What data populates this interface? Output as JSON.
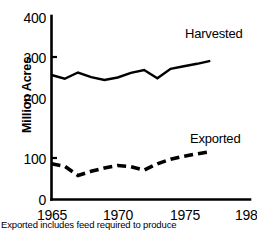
{
  "chart_data": {
    "type": "line",
    "title": "",
    "subtitle": "",
    "xlabel": "",
    "ylabel": "Million Acres",
    "xlim": [
      1965,
      1980
    ],
    "ylim": [
      0,
      400
    ],
    "xticks": [
      "1965",
      "1970",
      "1975",
      "1980"
    ],
    "yticks": [
      "0",
      "100",
      "200",
      "300",
      "400"
    ],
    "grid": false,
    "legend_position": "inline-right",
    "annotation": "Exported includes feed required to produce",
    "series": [
      {
        "name": "Harvested",
        "style": "solid",
        "color": "#000000",
        "x": [
          1965,
          1966,
          1967,
          1968,
          1969,
          1970,
          1971,
          1972,
          1973,
          1974,
          1975,
          1976,
          1977
        ],
        "values": [
          300,
          291,
          306,
          295,
          288,
          294,
          305,
          312,
          292,
          315,
          321,
          327,
          334
        ]
      },
      {
        "name": "Exported",
        "style": "dashed",
        "color": "#000000",
        "x": [
          1965,
          1966,
          1967,
          1968,
          1969,
          1970,
          1971,
          1972,
          1973,
          1974,
          1975,
          1976,
          1977
        ],
        "values": [
          86,
          80,
          58,
          68,
          76,
          82,
          79,
          71,
          86,
          97,
          104,
          110,
          115
        ]
      }
    ]
  },
  "axes": {
    "y_label": "Million Acres",
    "y_ticks": [
      {
        "label": "400",
        "value": 400
      },
      {
        "label": "300",
        "value": 300
      },
      {
        "label": "200",
        "value": 200
      },
      {
        "label": "100",
        "value": 100
      },
      {
        "label": "0",
        "value": 0
      }
    ],
    "x_ticks": [
      {
        "label": "1965",
        "value": 1965
      },
      {
        "label": "1970",
        "value": 1970
      },
      {
        "label": "1975",
        "value": 1975
      },
      {
        "label": "1980",
        "value": 1980
      }
    ]
  },
  "labels": {
    "harvested": "Harvested",
    "exported": "Exported"
  },
  "footnote": "Exported includes feed required to produce"
}
